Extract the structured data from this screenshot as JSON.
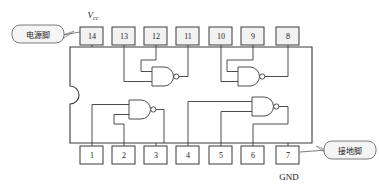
{
  "diagram": {
    "chip": {
      "name": "dip14-package",
      "notch": "left-side-semicircle"
    },
    "labels": {
      "vcc": "V",
      "vcc_sub": "cc",
      "gnd": "GND"
    },
    "callouts": [
      {
        "id": "power-pin",
        "text": "电源脚",
        "target_pin": "14"
      },
      {
        "id": "ground-pin",
        "text": "接地脚",
        "target_pin": "7"
      }
    ],
    "pins_top": [
      {
        "number": "14",
        "x": 92
      },
      {
        "number": "13",
        "x": 124
      },
      {
        "number": "12",
        "x": 156
      },
      {
        "number": "11",
        "x": 188
      },
      {
        "number": "10",
        "x": 221
      },
      {
        "number": "9",
        "x": 253
      },
      {
        "number": "8",
        "x": 288
      }
    ],
    "pins_bottom": [
      {
        "number": "1",
        "x": 92
      },
      {
        "number": "2",
        "x": 124
      },
      {
        "number": "3",
        "x": 156
      },
      {
        "number": "4",
        "x": 188
      },
      {
        "number": "5",
        "x": 221
      },
      {
        "number": "6",
        "x": 253
      },
      {
        "number": "7",
        "x": 288
      }
    ],
    "gates": [
      {
        "id": "gate-top-left",
        "inputs": [
          "13",
          "12"
        ],
        "output": "11"
      },
      {
        "id": "gate-top-right",
        "inputs": [
          "10",
          "9"
        ],
        "output": "8"
      },
      {
        "id": "gate-bottom-left",
        "inputs": [
          "1",
          "2"
        ],
        "output": "3"
      },
      {
        "id": "gate-bottom-right",
        "inputs": [
          "4",
          "5"
        ],
        "output": "6"
      }
    ],
    "colors": {
      "line": "#3a3a3a",
      "pin_fill": "#f2f2f2",
      "callout_fill": "#f5f5f5",
      "background": "#ffffff"
    }
  }
}
